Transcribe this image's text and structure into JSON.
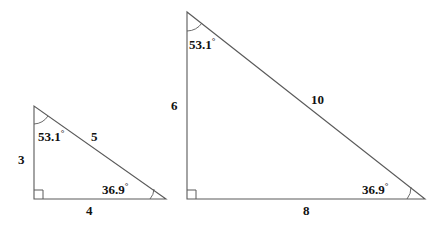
{
  "figure": {
    "stroke_color": "#5a5a5a",
    "text_color": "#111111",
    "background": "#ffffff",
    "degree_symbol": "°"
  },
  "triangles": [
    {
      "name": "small-triangle",
      "vertices": {
        "apex": [
          34,
          106
        ],
        "right_angle": [
          34,
          199
        ],
        "base_right": [
          166,
          199
        ]
      },
      "sides": {
        "vertical_leg": "3",
        "horizontal_leg": "4",
        "hypotenuse": "5"
      },
      "angles": {
        "apex": "53.1",
        "base_right": "36.9",
        "right_angle_marker": true
      },
      "labels": {
        "vertical_leg": {
          "text": "3",
          "x": 18,
          "y": 153
        },
        "horizontal_leg": {
          "text": "4",
          "x": 86,
          "y": 204
        },
        "hypotenuse": {
          "text": "5",
          "x": 91,
          "y": 130
        },
        "apex_angle": {
          "text": "53.1",
          "x": 38,
          "y": 130
        },
        "base_right_angle": {
          "text": "36.9",
          "x": 102,
          "y": 183
        }
      }
    },
    {
      "name": "large-triangle",
      "vertices": {
        "apex": [
          187,
          12
        ],
        "right_angle": [
          187,
          199
        ],
        "base_right": [
          425,
          199
        ]
      },
      "sides": {
        "vertical_leg": "6",
        "horizontal_leg": "8",
        "hypotenuse": "10"
      },
      "angles": {
        "apex": "53.1",
        "base_right": "36.9",
        "right_angle_marker": true
      },
      "labels": {
        "vertical_leg": {
          "text": "6",
          "x": 171,
          "y": 99
        },
        "horizontal_leg": {
          "text": "8",
          "x": 303,
          "y": 204
        },
        "hypotenuse": {
          "text": "10",
          "x": 311,
          "y": 93
        },
        "apex_angle": {
          "text": "53.1",
          "x": 189,
          "y": 38
        },
        "base_right_angle": {
          "text": "36.9",
          "x": 362,
          "y": 183
        }
      }
    }
  ]
}
